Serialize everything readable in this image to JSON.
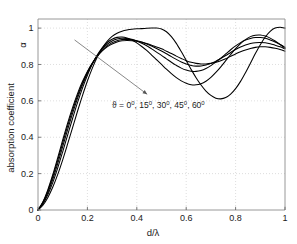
{
  "chart_data": {
    "type": "line",
    "title": "",
    "xlabel": "d/λ",
    "ylabel": "absorption coefficient",
    "ylabel_symbol": "α",
    "xlim": [
      0,
      1
    ],
    "ylim": [
      0,
      1.05
    ],
    "xticks": [
      0,
      0.2,
      0.4,
      0.6,
      0.8,
      1
    ],
    "xticklabels": [
      "0",
      "0.2",
      "0.4",
      "0.6",
      "0.8",
      "1"
    ],
    "yticks": [
      0,
      0.2,
      0.4,
      0.6,
      0.8,
      1
    ],
    "yticklabels": [
      "0",
      "0.2",
      "0.4",
      "0.6",
      "0.8",
      "1"
    ],
    "grid": true,
    "grid_style": "dotted",
    "legend_position": "none",
    "annotation": {
      "symbol": "ϑ",
      "equals": " = ",
      "values": [
        "0",
        "15",
        "30",
        "45",
        "60"
      ],
      "degree": "0",
      "separator": ", ",
      "full_text": "ϑ = 0⁰, 15⁰, 30⁰, 45⁰, 60⁰",
      "x": 0.3,
      "y": 0.56
    },
    "arrow": {
      "label": "increasing angle",
      "from": [
        0.148,
        0.935
      ],
      "to": [
        0.442,
        0.636
      ]
    },
    "x": [
      0,
      0.02,
      0.04,
      0.06,
      0.08,
      0.1,
      0.12,
      0.14,
      0.16,
      0.18,
      0.2,
      0.22,
      0.24,
      0.26,
      0.28,
      0.3,
      0.32,
      0.34,
      0.36,
      0.38,
      0.4,
      0.42,
      0.44,
      0.46,
      0.48,
      0.5,
      0.52,
      0.54,
      0.56,
      0.58,
      0.6,
      0.62,
      0.64,
      0.66,
      0.68,
      0.7,
      0.72,
      0.74,
      0.76,
      0.78,
      0.8,
      0.82,
      0.84,
      0.86,
      0.88,
      0.9,
      0.92,
      0.94,
      0.96,
      0.98,
      1
    ],
    "series": [
      {
        "name": "ϑ = 0°",
        "values": [
          0.0,
          0.045,
          0.112,
          0.195,
          0.288,
          0.385,
          0.478,
          0.563,
          0.64,
          0.706,
          0.762,
          0.808,
          0.845,
          0.875,
          0.897,
          0.913,
          0.924,
          0.93,
          0.932,
          0.931,
          0.928,
          0.922,
          0.915,
          0.906,
          0.896,
          0.886,
          0.873,
          0.86,
          0.846,
          0.833,
          0.821,
          0.812,
          0.806,
          0.803,
          0.803,
          0.806,
          0.812,
          0.821,
          0.832,
          0.845,
          0.858,
          0.87,
          0.88,
          0.888,
          0.894,
          0.897,
          0.897,
          0.894,
          0.889,
          0.882,
          0.873
        ]
      },
      {
        "name": "ϑ = 15°",
        "values": [
          0.0,
          0.042,
          0.105,
          0.184,
          0.274,
          0.369,
          0.462,
          0.549,
          0.628,
          0.697,
          0.757,
          0.806,
          0.846,
          0.878,
          0.902,
          0.92,
          0.931,
          0.937,
          0.938,
          0.936,
          0.931,
          0.923,
          0.913,
          0.901,
          0.888,
          0.874,
          0.859,
          0.843,
          0.828,
          0.814,
          0.803,
          0.795,
          0.791,
          0.792,
          0.797,
          0.806,
          0.818,
          0.833,
          0.849,
          0.866,
          0.882,
          0.896,
          0.907,
          0.915,
          0.92,
          0.921,
          0.919,
          0.914,
          0.906,
          0.897,
          0.886
        ]
      },
      {
        "name": "ϑ = 30°",
        "values": [
          0.0,
          0.038,
          0.096,
          0.17,
          0.256,
          0.348,
          0.442,
          0.531,
          0.614,
          0.688,
          0.752,
          0.806,
          0.85,
          0.885,
          0.911,
          0.929,
          0.94,
          0.944,
          0.943,
          0.938,
          0.929,
          0.917,
          0.903,
          0.886,
          0.868,
          0.85,
          0.831,
          0.812,
          0.795,
          0.78,
          0.769,
          0.763,
          0.762,
          0.767,
          0.778,
          0.794,
          0.813,
          0.835,
          0.858,
          0.881,
          0.902,
          0.92,
          0.934,
          0.943,
          0.948,
          0.948,
          0.944,
          0.935,
          0.924,
          0.91,
          0.895
        ]
      },
      {
        "name": "ϑ = 45°",
        "values": [
          0.0,
          0.033,
          0.085,
          0.152,
          0.232,
          0.32,
          0.412,
          0.503,
          0.59,
          0.67,
          0.741,
          0.802,
          0.852,
          0.891,
          0.92,
          0.939,
          0.949,
          0.951,
          0.946,
          0.935,
          0.919,
          0.899,
          0.877,
          0.852,
          0.826,
          0.8,
          0.774,
          0.75,
          0.728,
          0.71,
          0.697,
          0.689,
          0.688,
          0.694,
          0.708,
          0.729,
          0.756,
          0.787,
          0.821,
          0.855,
          0.887,
          0.915,
          0.937,
          0.953,
          0.961,
          0.962,
          0.956,
          0.945,
          0.929,
          0.91,
          0.89
        ]
      },
      {
        "name": "ϑ = 60°",
        "values": [
          0.0,
          0.026,
          0.069,
          0.126,
          0.196,
          0.276,
          0.363,
          0.453,
          0.543,
          0.629,
          0.709,
          0.78,
          0.841,
          0.89,
          0.927,
          0.954,
          0.972,
          0.983,
          0.99,
          0.994,
          0.996,
          0.997,
          0.999,
          1.0,
          1.0,
          0.995,
          0.98,
          0.953,
          0.916,
          0.871,
          0.822,
          0.773,
          0.727,
          0.687,
          0.654,
          0.63,
          0.615,
          0.611,
          0.618,
          0.637,
          0.667,
          0.707,
          0.755,
          0.807,
          0.86,
          0.909,
          0.951,
          0.982,
          1.0,
          1.005,
          1.0
        ]
      }
    ]
  }
}
